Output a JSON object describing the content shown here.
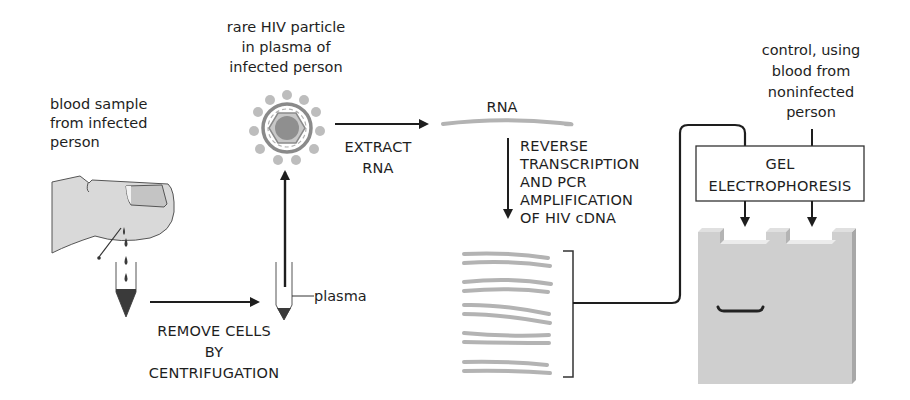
{
  "diagram": {
    "colors": {
      "ink": "#1e1e1e",
      "finger": "#d9d9d9",
      "nail": "#c4c4c4",
      "blood": "#3a3a3a",
      "virus": "#a9a9a9",
      "virus_core": "#8f8f8f",
      "strand": "#b3b3b3",
      "gel": "#cfcfcf",
      "gel_side": "#a8a8a8",
      "band": "#222222"
    },
    "labels": {
      "blood_sample": [
        "blood sample",
        "from infected",
        "person"
      ],
      "hiv_particle": [
        "rare HIV particle",
        "in plasma of",
        "infected person"
      ],
      "extract_rna": [
        "EXTRACT",
        "RNA"
      ],
      "rna": "RNA",
      "rt_pcr": [
        "REVERSE",
        "TRANSCRIPTION",
        "AND PCR",
        "AMPLIFICATION",
        "OF HIV cDNA"
      ],
      "remove_cells": [
        "REMOVE CELLS",
        "BY",
        "CENTRIFUGATION"
      ],
      "plasma": "plasma",
      "control": [
        "control, using",
        "blood from",
        "noninfected",
        "person"
      ],
      "gel_box": [
        "GEL",
        "ELECTROPHORESIS"
      ]
    },
    "steps": [
      {
        "id": "blood-sample",
        "label": "blood sample from infected person"
      },
      {
        "id": "centrifugation",
        "label": "REMOVE CELLS BY CENTRIFUGATION"
      },
      {
        "id": "plasma",
        "label": "plasma"
      },
      {
        "id": "hiv-particle",
        "label": "rare HIV particle in plasma of infected person"
      },
      {
        "id": "extract-rna",
        "label": "EXTRACT RNA"
      },
      {
        "id": "rna",
        "label": "RNA"
      },
      {
        "id": "rt-pcr",
        "label": "REVERSE TRANSCRIPTION AND PCR AMPLIFICATION OF HIV cDNA"
      },
      {
        "id": "gel-electrophoresis",
        "label": "GEL ELECTROPHORESIS"
      },
      {
        "id": "control",
        "label": "control, using blood from noninfected person"
      }
    ],
    "gel": {
      "lanes": 2,
      "band_lane": 1
    }
  }
}
